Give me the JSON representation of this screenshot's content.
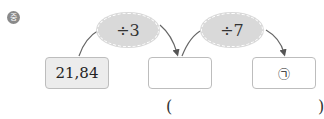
{
  "badge": {
    "label": "중"
  },
  "operations": [
    {
      "label": "÷3"
    },
    {
      "label": "÷7"
    }
  ],
  "boxes": [
    {
      "value": "21,84"
    },
    {
      "value": ""
    },
    {
      "value": "㉠"
    }
  ],
  "answer": {
    "open": "(",
    "close": ")"
  }
}
